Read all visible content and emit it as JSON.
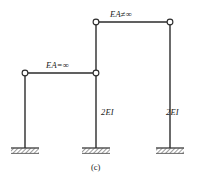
{
  "figure": {
    "caption": "(c)",
    "type": "structural-frame-diagram"
  },
  "labels": {
    "top_beam": "EA≠∞",
    "mid_beam": "EA=∞",
    "column_middle": "2EI",
    "column_right": "2EI"
  },
  "colors": {
    "line": "#2b2b2b",
    "fill": "#ffffff",
    "hatch": "#3a3a3a",
    "text": "#1a1a1a",
    "background": "#ffffff"
  },
  "geometry": {
    "columns": [
      {
        "name": "left-column",
        "x": 25,
        "y_top": 73,
        "y_base": 148
      },
      {
        "name": "middle-column",
        "x": 96,
        "y_top": 22,
        "y_base": 148
      },
      {
        "name": "right-column",
        "x": 170,
        "y_top": 22,
        "y_base": 148
      }
    ],
    "beams": [
      {
        "name": "top-beam",
        "y": 22,
        "x_start": 96,
        "x_end": 170
      },
      {
        "name": "mid-beam",
        "y": 73,
        "x_start": 25,
        "x_end": 96
      }
    ],
    "hinges": [
      {
        "name": "hinge-top-left",
        "x": 96,
        "y": 22
      },
      {
        "name": "hinge-top-right",
        "x": 170,
        "y": 22
      },
      {
        "name": "hinge-mid-left",
        "x": 25,
        "y": 73
      },
      {
        "name": "hinge-mid-right",
        "x": 96,
        "y": 73
      }
    ],
    "supports": [
      {
        "name": "fixed-support-left",
        "x": 25,
        "y": 148
      },
      {
        "name": "fixed-support-middle",
        "x": 96,
        "y": 148
      },
      {
        "name": "fixed-support-right",
        "x": 170,
        "y": 148
      }
    ]
  }
}
